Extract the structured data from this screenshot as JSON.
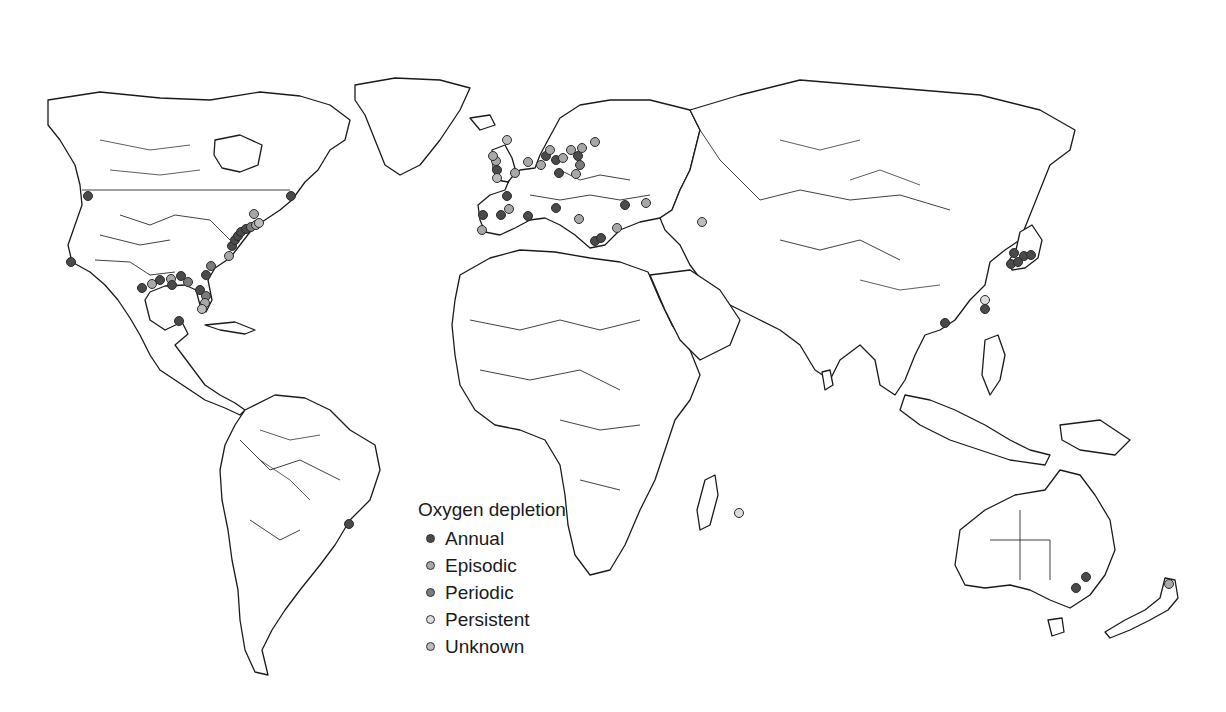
{
  "legend": {
    "title": "Oxygen depletion",
    "items": [
      {
        "label": "Annual",
        "color": "#4a4a4a"
      },
      {
        "label": "Episodic",
        "color": "#a8a8a8"
      },
      {
        "label": "Periodic",
        "color": "#7c7c7c"
      },
      {
        "label": "Persistent",
        "color": "#dcdcdc"
      },
      {
        "label": "Unknown",
        "color": "#bcbcbc"
      }
    ]
  },
  "map": {
    "projection": "world outline with country borders and major rivers",
    "sites": [
      {
        "region": "Pacific NW (Puget Sound)",
        "x": 88,
        "y": 196,
        "type": "Annual"
      },
      {
        "region": "California",
        "x": 71,
        "y": 262,
        "type": "Annual"
      },
      {
        "region": "Gulf of Mexico - Texas",
        "x": 142,
        "y": 288,
        "type": "Annual"
      },
      {
        "region": "Gulf of Mexico - Texas",
        "x": 152,
        "y": 284,
        "type": "Episodic"
      },
      {
        "region": "Gulf of Mexico - Louisiana",
        "x": 160,
        "y": 280,
        "type": "Annual"
      },
      {
        "region": "Gulf of Mexico - Louisiana",
        "x": 171,
        "y": 279,
        "type": "Episodic"
      },
      {
        "region": "Gulf of Mexico - Mississippi",
        "x": 181,
        "y": 276,
        "type": "Annual"
      },
      {
        "region": "Gulf of Mexico",
        "x": 188,
        "y": 282,
        "type": "Periodic"
      },
      {
        "region": "Gulf of Mexico",
        "x": 172,
        "y": 285,
        "type": "Annual"
      },
      {
        "region": "Florida west",
        "x": 200,
        "y": 290,
        "type": "Annual"
      },
      {
        "region": "Florida",
        "x": 206,
        "y": 296,
        "type": "Periodic"
      },
      {
        "region": "Florida",
        "x": 205,
        "y": 303,
        "type": "Episodic"
      },
      {
        "region": "Florida keys",
        "x": 202,
        "y": 309,
        "type": "Unknown"
      },
      {
        "region": "Yucatan",
        "x": 179,
        "y": 321,
        "type": "Annual"
      },
      {
        "region": "Georgia",
        "x": 206,
        "y": 275,
        "type": "Annual"
      },
      {
        "region": "Carolina",
        "x": 211,
        "y": 266,
        "type": "Periodic"
      },
      {
        "region": "Chesapeake",
        "x": 229,
        "y": 256,
        "type": "Episodic"
      },
      {
        "region": "Chesapeake",
        "x": 232,
        "y": 246,
        "type": "Annual"
      },
      {
        "region": "Chesapeake",
        "x": 235,
        "y": 240,
        "type": "Annual"
      },
      {
        "region": "Delaware",
        "x": 238,
        "y": 236,
        "type": "Annual"
      },
      {
        "region": "New Jersey",
        "x": 241,
        "y": 232,
        "type": "Annual"
      },
      {
        "region": "Long Island Sound",
        "x": 246,
        "y": 229,
        "type": "Annual"
      },
      {
        "region": "New England",
        "x": 251,
        "y": 227,
        "type": "Periodic"
      },
      {
        "region": "New England",
        "x": 256,
        "y": 225,
        "type": "Episodic"
      },
      {
        "region": "New England",
        "x": 259,
        "y": 223,
        "type": "Unknown"
      },
      {
        "region": "Massachusetts",
        "x": 254,
        "y": 214,
        "type": "Episodic"
      },
      {
        "region": "St Lawrence",
        "x": 291,
        "y": 196,
        "type": "Annual"
      },
      {
        "region": "Brazil",
        "x": 349,
        "y": 524,
        "type": "Annual"
      },
      {
        "region": "Ireland",
        "x": 496,
        "y": 161,
        "type": "Episodic"
      },
      {
        "region": "Scotland",
        "x": 493,
        "y": 156,
        "type": "Episodic"
      },
      {
        "region": "Irish Sea",
        "x": 497,
        "y": 170,
        "type": "Annual"
      },
      {
        "region": "UK east",
        "x": 515,
        "y": 173,
        "type": "Episodic"
      },
      {
        "region": "UK south",
        "x": 497,
        "y": 178,
        "type": "Unknown"
      },
      {
        "region": "Norway",
        "x": 507,
        "y": 140,
        "type": "Unknown"
      },
      {
        "region": "North Sea",
        "x": 528,
        "y": 162,
        "type": "Episodic"
      },
      {
        "region": "Denmark",
        "x": 546,
        "y": 156,
        "type": "Annual"
      },
      {
        "region": "Kattegat",
        "x": 550,
        "y": 150,
        "type": "Episodic"
      },
      {
        "region": "Baltic",
        "x": 556,
        "y": 160,
        "type": "Annual"
      },
      {
        "region": "Baltic",
        "x": 563,
        "y": 158,
        "type": "Episodic"
      },
      {
        "region": "Germany coast",
        "x": 541,
        "y": 165,
        "type": "Episodic"
      },
      {
        "region": "Baltic",
        "x": 571,
        "y": 150,
        "type": "Episodic"
      },
      {
        "region": "Baltic",
        "x": 578,
        "y": 156,
        "type": "Annual"
      },
      {
        "region": "Gulf of Finland",
        "x": 595,
        "y": 142,
        "type": "Episodic"
      },
      {
        "region": "Baltic",
        "x": 582,
        "y": 148,
        "type": "Episodic"
      },
      {
        "region": "Baltic",
        "x": 580,
        "y": 165,
        "type": "Periodic"
      },
      {
        "region": "Baltic",
        "x": 576,
        "y": 174,
        "type": "Episodic"
      },
      {
        "region": "Poland",
        "x": 559,
        "y": 173,
        "type": "Annual"
      },
      {
        "region": "France Atlantic",
        "x": 507,
        "y": 196,
        "type": "Annual"
      },
      {
        "region": "Biscay",
        "x": 501,
        "y": 215,
        "type": "Annual"
      },
      {
        "region": "Spain",
        "x": 483,
        "y": 215,
        "type": "Annual"
      },
      {
        "region": "Portugal",
        "x": 482,
        "y": 230,
        "type": "Episodic"
      },
      {
        "region": "Spain north",
        "x": 509,
        "y": 209,
        "type": "Episodic"
      },
      {
        "region": "Mediterranean France",
        "x": 528,
        "y": 216,
        "type": "Annual"
      },
      {
        "region": "Adriatic",
        "x": 556,
        "y": 208,
        "type": "Annual"
      },
      {
        "region": "Adriatic",
        "x": 579,
        "y": 219,
        "type": "Episodic"
      },
      {
        "region": "Aegean",
        "x": 595,
        "y": 241,
        "type": "Annual"
      },
      {
        "region": "Aegean",
        "x": 601,
        "y": 238,
        "type": "Annual"
      },
      {
        "region": "Black Sea",
        "x": 625,
        "y": 205,
        "type": "Annual"
      },
      {
        "region": "Black Sea",
        "x": 646,
        "y": 203,
        "type": "Episodic"
      },
      {
        "region": "Marmara",
        "x": 617,
        "y": 228,
        "type": "Episodic"
      },
      {
        "region": "Caspian",
        "x": 702,
        "y": 222,
        "type": "Unknown"
      },
      {
        "region": "Korea/Japan",
        "x": 1014,
        "y": 253,
        "type": "Annual"
      },
      {
        "region": "Japan",
        "x": 1024,
        "y": 256,
        "type": "Annual"
      },
      {
        "region": "Japan",
        "x": 1031,
        "y": 255,
        "type": "Annual"
      },
      {
        "region": "Japan",
        "x": 1011,
        "y": 264,
        "type": "Annual"
      },
      {
        "region": "Japan",
        "x": 1018,
        "y": 262,
        "type": "Annual"
      },
      {
        "region": "Taiwan Strait",
        "x": 985,
        "y": 300,
        "type": "Persistent"
      },
      {
        "region": "Taiwan Strait",
        "x": 985,
        "y": 309,
        "type": "Annual"
      },
      {
        "region": "Hong Kong",
        "x": 945,
        "y": 323,
        "type": "Annual"
      },
      {
        "region": "Mauritius",
        "x": 739,
        "y": 513,
        "type": "Persistent"
      },
      {
        "region": "Australia east",
        "x": 1086,
        "y": 577,
        "type": "Annual"
      },
      {
        "region": "Australia east",
        "x": 1076,
        "y": 588,
        "type": "Annual"
      },
      {
        "region": "New Zealand north",
        "x": 1169,
        "y": 584,
        "type": "Episodic"
      }
    ]
  }
}
